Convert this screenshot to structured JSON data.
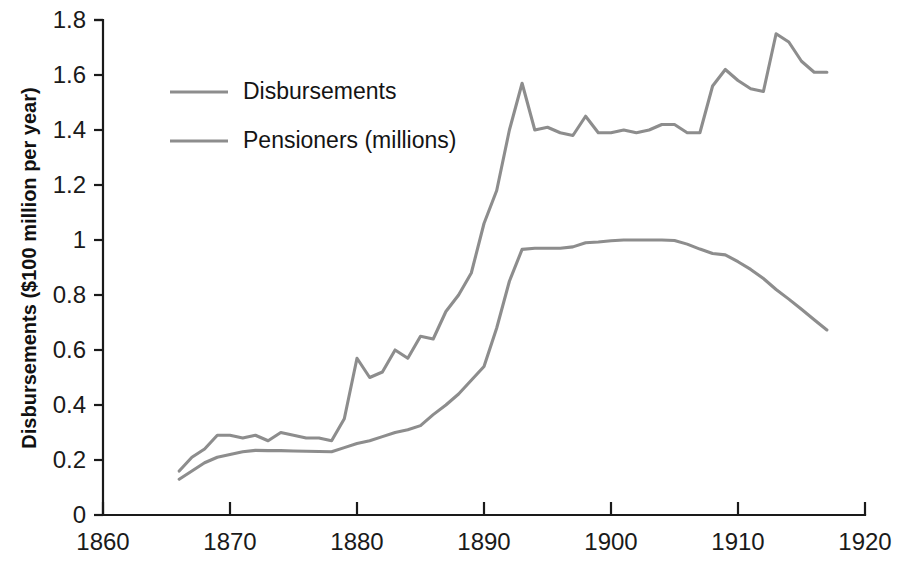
{
  "chart_data": {
    "type": "line",
    "title": "",
    "xlabel": "",
    "ylabel": "Disbursements ($100 million per year)",
    "xlim": [
      1860,
      1920
    ],
    "ylim": [
      0,
      1.8
    ],
    "grid": false,
    "legend_position": "top-left",
    "xticks": [
      1860,
      1870,
      1880,
      1890,
      1900,
      1910,
      1920
    ],
    "xtick_labels": [
      "1860",
      "1870",
      "1880",
      "1890",
      "1900",
      "1910",
      "1920"
    ],
    "yticks": [
      0,
      0.2,
      0.4,
      0.6,
      0.8,
      1.0,
      1.2,
      1.4,
      1.6,
      1.8
    ],
    "ytick_labels": [
      "0",
      "0.2",
      "0.4",
      "0.6",
      "0.8",
      "1",
      "1.2",
      "1.4",
      "1.6",
      "1.8"
    ],
    "line_color": "#8d8d8d",
    "axis_color": "#1a1a1a",
    "series": [
      {
        "name": "Disbursements",
        "x": [
          1866,
          1867,
          1868,
          1869,
          1870,
          1871,
          1872,
          1873,
          1874,
          1875,
          1876,
          1877,
          1878,
          1879,
          1880,
          1881,
          1882,
          1883,
          1884,
          1885,
          1886,
          1887,
          1888,
          1889,
          1890,
          1891,
          1892,
          1893,
          1894,
          1895,
          1896,
          1897,
          1898,
          1899,
          1900,
          1901,
          1902,
          1903,
          1904,
          1905,
          1906,
          1907,
          1908,
          1909,
          1910,
          1911,
          1912,
          1913,
          1914,
          1915,
          1916,
          1917
        ],
        "values": [
          0.16,
          0.21,
          0.24,
          0.29,
          0.29,
          0.28,
          0.29,
          0.27,
          0.3,
          0.29,
          0.28,
          0.28,
          0.27,
          0.35,
          0.57,
          0.5,
          0.52,
          0.6,
          0.57,
          0.65,
          0.64,
          0.74,
          0.8,
          0.88,
          1.06,
          1.18,
          1.4,
          1.57,
          1.4,
          1.41,
          1.39,
          1.38,
          1.45,
          1.39,
          1.39,
          1.4,
          1.39,
          1.4,
          1.42,
          1.42,
          1.39,
          1.39,
          1.56,
          1.62,
          1.58,
          1.55,
          1.54,
          1.75,
          1.72,
          1.65,
          1.61,
          1.61
        ],
        "color": "#8d8d8d"
      },
      {
        "name": "Pensioners (millions)",
        "x": [
          1866,
          1867,
          1868,
          1869,
          1870,
          1871,
          1872,
          1873,
          1874,
          1875,
          1876,
          1877,
          1878,
          1879,
          1880,
          1881,
          1882,
          1883,
          1884,
          1885,
          1886,
          1887,
          1888,
          1889,
          1890,
          1891,
          1892,
          1893,
          1894,
          1895,
          1896,
          1897,
          1898,
          1899,
          1900,
          1901,
          1902,
          1903,
          1904,
          1905,
          1906,
          1907,
          1908,
          1909,
          1910,
          1911,
          1912,
          1913,
          1914,
          1915,
          1916,
          1917
        ],
        "values": [
          0.13,
          0.16,
          0.19,
          0.21,
          0.22,
          0.23,
          0.235,
          0.234,
          0.234,
          0.233,
          0.232,
          0.231,
          0.23,
          0.245,
          0.26,
          0.27,
          0.285,
          0.3,
          0.31,
          0.325,
          0.365,
          0.4,
          0.44,
          0.49,
          0.54,
          0.68,
          0.85,
          0.966,
          0.97,
          0.97,
          0.97,
          0.975,
          0.99,
          0.993,
          0.997,
          1.0,
          1.0,
          1.0,
          1.0,
          0.998,
          0.985,
          0.967,
          0.951,
          0.946,
          0.921,
          0.893,
          0.86,
          0.82,
          0.785,
          0.748,
          0.71,
          0.673
        ],
        "color": "#8d8d8d"
      }
    ],
    "legend": [
      {
        "label": "Disbursements",
        "color": "#8d8d8d"
      },
      {
        "label": "Pensioners (millions)",
        "color": "#8d8d8d"
      }
    ]
  }
}
